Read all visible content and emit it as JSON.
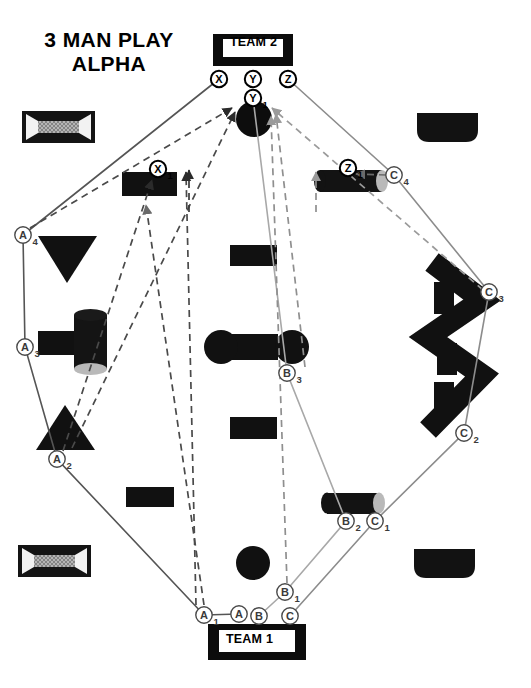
{
  "title": {
    "line1": "3 MAN PLAY",
    "line2": "ALPHA"
  },
  "teams": {
    "top": {
      "label": "TEAM 2"
    },
    "bottom": {
      "label": "TEAM 1"
    }
  },
  "colors": {
    "ink": "#000000",
    "player_a_path": "#555555",
    "player_b_path": "#a8a8a8",
    "player_c_path": "#8c8c8c",
    "fill_obstacle": "#111111",
    "net_fill": "#9e9e9e",
    "cylinder_cap": "#b9b9b9"
  },
  "markers": {
    "team2": [
      {
        "id": "X",
        "label": "X",
        "sub": "",
        "x": 219,
        "y": 79
      },
      {
        "id": "Y",
        "label": "Y",
        "sub": "",
        "x": 253,
        "y": 79
      },
      {
        "id": "Z",
        "label": "Z",
        "sub": "",
        "x": 288,
        "y": 79
      },
      {
        "id": "Y1",
        "label": "Y",
        "sub": "1",
        "x": 253,
        "y": 98
      },
      {
        "id": "X1",
        "label": "X",
        "sub": "1",
        "x": 158,
        "y": 169
      },
      {
        "id": "Z1",
        "label": "Z",
        "sub": "1",
        "x": 348,
        "y": 168
      }
    ],
    "team1": [
      {
        "id": "A1",
        "label": "A",
        "sub": "1",
        "x": 204,
        "y": 615
      },
      {
        "id": "A",
        "label": "A",
        "sub": "",
        "x": 239,
        "y": 614
      },
      {
        "id": "B",
        "label": "B",
        "sub": "",
        "x": 259,
        "y": 616
      },
      {
        "id": "C",
        "label": "C",
        "sub": "",
        "x": 290,
        "y": 616
      },
      {
        "id": "A2",
        "label": "A",
        "sub": "2",
        "x": 57,
        "y": 459
      },
      {
        "id": "A3",
        "label": "A",
        "sub": "3",
        "x": 25,
        "y": 347
      },
      {
        "id": "A4",
        "label": "A",
        "sub": "4",
        "x": 23,
        "y": 235
      },
      {
        "id": "B1",
        "label": "B",
        "sub": "1",
        "x": 285,
        "y": 592
      },
      {
        "id": "B2",
        "label": "B",
        "sub": "2",
        "x": 346,
        "y": 521
      },
      {
        "id": "B3",
        "label": "B",
        "sub": "3",
        "x": 287,
        "y": 373
      },
      {
        "id": "C1",
        "label": "C",
        "sub": "1",
        "x": 375,
        "y": 521
      },
      {
        "id": "C2",
        "label": "C",
        "sub": "2",
        "x": 464,
        "y": 433
      },
      {
        "id": "C3",
        "label": "C",
        "sub": "3",
        "x": 489,
        "y": 292
      },
      {
        "id": "C4",
        "label": "C",
        "sub": "4",
        "x": 394,
        "y": 175
      }
    ]
  },
  "chart_data": {
    "type": "diagram",
    "title": "3 MAN PLAY ALPHA",
    "movement_paths": [
      {
        "player": "A",
        "style": "solid",
        "color": "#555555",
        "points": "239,614 204,615 57,459 25,347 23,235 219,79"
      },
      {
        "player": "B",
        "style": "solid",
        "color": "#a8a8a8",
        "points": "259,616 285,592 346,521 287,373 253,98"
      },
      {
        "player": "C",
        "style": "solid",
        "color": "#8c8c8c",
        "points": "290,616 375,521 464,433 489,292 394,175 288,79"
      }
    ],
    "fire_lines": [
      {
        "from": "A4",
        "to": "Y1",
        "style": "dashed"
      },
      {
        "from": "A2",
        "to": "X1",
        "style": "dashed"
      },
      {
        "from": "A1",
        "to": "X1",
        "style": "dashed"
      },
      {
        "from": "B1",
        "to": "Y1",
        "style": "dashed"
      },
      {
        "from": "C3",
        "to": "Y1",
        "style": "dashed"
      },
      {
        "from": "C4",
        "to": "Z1",
        "style": "dashed"
      }
    ]
  },
  "obstacles": [
    {
      "name": "net-goal-top-left",
      "type": "net-box"
    },
    {
      "name": "net-goal-bottom-left",
      "type": "net-box"
    },
    {
      "name": "solid-dome-top-right",
      "type": "dome"
    },
    {
      "name": "solid-dome-bottom-right",
      "type": "dome"
    },
    {
      "name": "triangle-left-upper",
      "type": "triangle-down"
    },
    {
      "name": "triangle-left-lower",
      "type": "triangle-up"
    },
    {
      "name": "bar-with-cylinder-left",
      "type": "bar-cylinder"
    },
    {
      "name": "bunker-center-upper",
      "type": "rect"
    },
    {
      "name": "dumbbell-center",
      "type": "dumbbell"
    },
    {
      "name": "bunker-center-lower",
      "type": "rect"
    },
    {
      "name": "circle-center-bottom",
      "type": "circle"
    },
    {
      "name": "zigzag-wall-right",
      "type": "zigzag"
    },
    {
      "name": "cylinder-top-center-left",
      "type": "rect"
    },
    {
      "name": "cylinder-top-right",
      "type": "cylinder-h"
    },
    {
      "name": "cylinder-bottom-right",
      "type": "cylinder-h"
    }
  ]
}
